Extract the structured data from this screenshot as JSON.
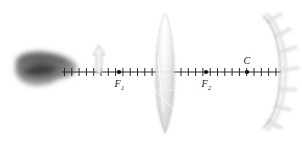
{
  "figure": {
    "name": "optics-lens-mirror-diagram",
    "width": 302,
    "height": 143,
    "background_color": "#ffffff"
  },
  "optical_axis": {
    "name": "optical-axis",
    "x_start": 62,
    "x_end": 281,
    "y": 72,
    "color": "#2b2b2b",
    "tick_half_height": 4,
    "tick_spacing": 7.3,
    "tick_count": 30
  },
  "elements": {
    "object_blob": {
      "label": "",
      "description": "blurred-gray-object",
      "center_x": 44,
      "center_y": 70,
      "rx": 32,
      "ry": 18,
      "color": "#6e6e6e"
    },
    "object_arrow": {
      "label": "",
      "description": "upright-object-arrow",
      "x": 99,
      "base_y": 73,
      "tip_y": 46,
      "stroke": "#b4b4b4",
      "fill": "#f2f2f2"
    },
    "lens": {
      "label": "",
      "description": "biconvex-converging-lens",
      "center_x": 165,
      "top_y": 14,
      "bottom_y": 133,
      "half_width": 13,
      "stroke": "#b9b9b9",
      "fill_light": "#ffffff",
      "fill_dark": "#d9d9d9"
    },
    "mirror": {
      "label": "",
      "description": "concave-spherical-mirror",
      "vertex_x": 281,
      "vertex_y": 72,
      "top_x": 263,
      "top_y": 16,
      "bottom_x": 263,
      "bottom_y": 128,
      "stroke": "#c6c6c6",
      "hatch_color": "#dedede",
      "hatch_count": 7
    }
  },
  "points": [
    {
      "id": "F1",
      "name": "focal-point-f1",
      "label": "F",
      "sub": "1",
      "x": 119,
      "y": 72,
      "label_x": 117,
      "label_y": 86,
      "dot_r": 2.1,
      "color": "#111111"
    },
    {
      "id": "F2",
      "name": "focal-point-f2",
      "label": "F",
      "sub": "2",
      "x": 206,
      "y": 72,
      "label_x": 204,
      "label_y": 86,
      "dot_r": 2.1,
      "color": "#111111"
    },
    {
      "id": "C",
      "name": "center-of-curvature-c",
      "label": "C",
      "sub": "",
      "x": 247,
      "y": 72,
      "label_x": 244,
      "label_y": 63,
      "dot_r": 2.1,
      "color": "#111111"
    }
  ]
}
